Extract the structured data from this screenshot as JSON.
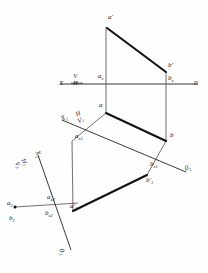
{
  "figure": {
    "ink_color": "#111111",
    "thin_color": "#3a3a3a",
    "background": "#fefefe"
  },
  "axes": {
    "system1": {
      "name": "X-0 ground line (V over H)",
      "left_label": "X",
      "right_label": "0",
      "upper_plane": "V",
      "lower_plane": "H"
    },
    "system2": {
      "name": "X1-01 ground line (H over V1)",
      "left_label": "X",
      "left_label_sub": "1",
      "right_label": "0",
      "right_label_sub": "1",
      "upper_plane": "H",
      "lower_plane": "V",
      "lower_plane_sub": "1"
    },
    "system3": {
      "name": "X2-02 ground line (H1 over V2)",
      "left_label": "X",
      "left_label_sub": "2",
      "right_label": "0",
      "right_label_sub": "2",
      "upper_plane": "H",
      "upper_plane_sub": "1",
      "lower_plane": "V",
      "lower_plane_sub": "2"
    }
  },
  "points": [
    {
      "key": "a_prime",
      "label": "a",
      "prime": "'",
      "sub": "",
      "x": 112,
      "y": 22,
      "dot": false
    },
    {
      "key": "b_prime",
      "label": "b",
      "prime": "'",
      "sub": "",
      "x": 164,
      "y": 69,
      "dot": false
    },
    {
      "key": "a_x",
      "label": "a",
      "prime": "",
      "sub": "x",
      "x": 106,
      "y": 78,
      "dot": false
    },
    {
      "key": "b_x",
      "label": "b",
      "prime": "",
      "sub": "x",
      "x": 164,
      "y": 81,
      "dot": false
    },
    {
      "key": "a",
      "label": "a",
      "prime": "",
      "sub": "",
      "x": 105,
      "y": 107,
      "dot": false
    },
    {
      "key": "b",
      "label": "b",
      "prime": "",
      "sub": "",
      "x": 165,
      "y": 136,
      "dot": false
    },
    {
      "key": "a_x1",
      "label": "a",
      "prime": "",
      "sub": "x1",
      "x": 104,
      "y": 136,
      "dot": false
    },
    {
      "key": "b_x1",
      "label": "b",
      "prime": "",
      "sub": "x1",
      "x": 154,
      "y": 165,
      "dot": false
    },
    {
      "key": "b1_prime",
      "label": "b",
      "prime": "'",
      "sub": "1",
      "x": 148,
      "y": 180,
      "dot": false
    },
    {
      "key": "a1_prime",
      "label": "a",
      "prime": "'",
      "sub": "1",
      "x": 74,
      "y": 206,
      "dot": false
    },
    {
      "key": "a_x2",
      "label": "a",
      "prime": "",
      "sub": "x2",
      "x": 50,
      "y": 199,
      "dot": false
    },
    {
      "key": "b_x2",
      "label": "b",
      "prime": "",
      "sub": "x2",
      "x": 47,
      "y": 213,
      "dot": false
    },
    {
      "key": "a2",
      "label": "a",
      "prime": "",
      "sub": "2",
      "x": 11,
      "y": 206,
      "dot": true
    },
    {
      "key": "b2",
      "label": "b",
      "prime": "",
      "sub": "2",
      "x": 11,
      "y": 221,
      "dot": false
    }
  ],
  "segments": {
    "heavy": [
      {
        "name": "a-prime-to-b-prime",
        "x1": 112,
        "y1": 28,
        "x2": 166,
        "y2": 71
      },
      {
        "name": "a-to-b",
        "x1": 106,
        "y1": 112,
        "x2": 166,
        "y2": 141
      },
      {
        "name": "a1-to-b1",
        "x1": 73,
        "y1": 211,
        "x2": 147,
        "y2": 174
      }
    ],
    "thin": [
      {
        "name": "a-prime-vertical-projector",
        "x1": 106,
        "y1": 26,
        "x2": 106,
        "y2": 112
      },
      {
        "name": "b-prime-vertical-projector",
        "x1": 166,
        "y1": 71,
        "x2": 166,
        "y2": 141
      },
      {
        "name": "a-projector-to-axis1",
        "x1": 106,
        "y1": 112,
        "x2": 72,
        "y2": 140
      },
      {
        "name": "b-projector-to-axis1",
        "x1": 166,
        "y1": 141,
        "x2": 147,
        "y2": 174
      },
      {
        "name": "a1-projector-long",
        "x1": 72,
        "y1": 140,
        "x2": 73,
        "y2": 211
      },
      {
        "name": "b1-projector",
        "x1": 147,
        "y1": 174,
        "x2": 147,
        "y2": 174
      },
      {
        "name": "a2-projector",
        "x1": 17,
        "y1": 207,
        "x2": 73,
        "y2": 211
      }
    ]
  }
}
